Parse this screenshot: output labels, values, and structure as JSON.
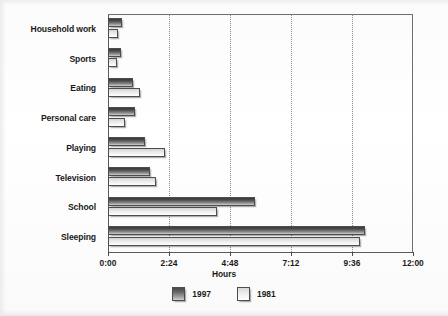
{
  "chart_data": {
    "type": "bar",
    "orientation": "horizontal",
    "title": "",
    "xlabel": "Hours",
    "ylabel": "",
    "categories": [
      "Household work",
      "Sports",
      "Eating",
      "Personal care",
      "Playing",
      "Television",
      "School",
      "Sleeping"
    ],
    "series": [
      {
        "name": "1997",
        "values": [
          0.55,
          0.5,
          1.0,
          1.05,
          1.45,
          1.65,
          5.8,
          10.1
        ]
      },
      {
        "name": "1981",
        "values": [
          0.4,
          0.35,
          1.25,
          0.67,
          2.25,
          1.9,
          4.3,
          9.9
        ]
      }
    ],
    "xlim": [
      0,
      12
    ],
    "xtick_values": [
      0,
      2.4,
      4.8,
      7.2,
      9.6,
      12
    ],
    "xtick_labels": [
      "0:00",
      "2:24",
      "4:48",
      "7:12",
      "9:36",
      "12:00"
    ],
    "grid": true,
    "grid_axis": "x",
    "grid_style": "dotted",
    "legend_position": "bottom-center",
    "legend_entries": [
      "1997",
      "1981"
    ],
    "colors": {
      "series_1997": "#4a4a4a",
      "series_1981": "#e8e8e8",
      "axis": "#5a5a5a",
      "gridline": "#8a8a8a",
      "text": "#1a1a1a",
      "background": "#ffffff"
    }
  }
}
